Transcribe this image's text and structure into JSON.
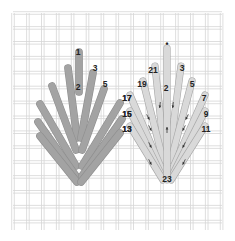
{
  "diagram": {
    "type": "needlepoint stitch diagram",
    "colors": {
      "background": "#ffffff",
      "canvas_grid": "#d6d6d6",
      "left_stitch_fill": "#a3a3a3",
      "left_stitch_stroke": "#8f8f8f",
      "right_stitch_fill": "#d9d9d9",
      "right_stitch_stroke": "#a8a8a8",
      "label": "#222222",
      "arrow": "#333333"
    },
    "left_leaf": {
      "description": "completed leaf stitch (shaded)",
      "labels": [
        {
          "text": "1",
          "x": 78,
          "y": 55
        },
        {
          "text": "2",
          "x": 78,
          "y": 90
        },
        {
          "text": "3",
          "x": 95,
          "y": 71
        },
        {
          "text": "5",
          "x": 105,
          "y": 87
        },
        {
          "text": "17",
          "x": 127,
          "y": 101
        },
        {
          "text": "15",
          "x": 127,
          "y": 117
        },
        {
          "text": "13",
          "x": 127,
          "y": 132
        }
      ]
    },
    "right_leaf": {
      "description": "stitch sequence with direction arrows",
      "labels": [
        {
          "text": "•",
          "x": 167,
          "y": 47
        },
        {
          "text": "21",
          "x": 153,
          "y": 73
        },
        {
          "text": "2",
          "x": 166,
          "y": 91
        },
        {
          "text": "3",
          "x": 182,
          "y": 71
        },
        {
          "text": "19",
          "x": 142,
          "y": 87
        },
        {
          "text": "5",
          "x": 192,
          "y": 87
        },
        {
          "text": "17",
          "x": 127,
          "y": 101
        },
        {
          "text": "7",
          "x": 204,
          "y": 101
        },
        {
          "text": "15",
          "x": 127,
          "y": 117
        },
        {
          "text": "9",
          "x": 206,
          "y": 117
        },
        {
          "text": "13",
          "x": 127,
          "y": 132
        },
        {
          "text": "11",
          "x": 206,
          "y": 132
        },
        {
          "text": "23",
          "x": 167,
          "y": 182
        }
      ]
    }
  }
}
